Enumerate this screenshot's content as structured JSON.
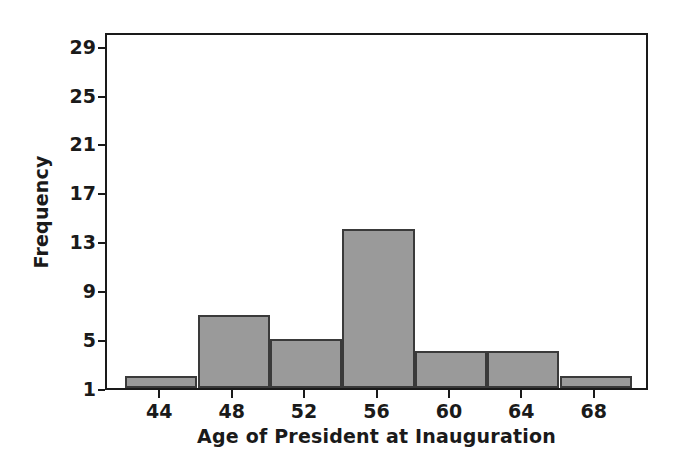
{
  "chart_data": {
    "type": "bar",
    "title": "",
    "subtitle": "",
    "xlabel": "Age of President at Inauguration",
    "ylabel": "Frequency",
    "categories": [
      "42-46",
      "46-50",
      "50-54",
      "54-58",
      "58-62",
      "62-66",
      "66-70"
    ],
    "bin_edges": [
      42,
      46,
      50,
      54,
      58,
      62,
      66,
      70
    ],
    "bin_width": 4,
    "values": [
      2,
      7,
      5,
      14,
      4,
      4,
      2
    ],
    "bars": [
      {
        "label": "42-46",
        "start": 42,
        "end": 46,
        "value": 2
      },
      {
        "label": "46-50",
        "start": 46,
        "end": 50,
        "value": 7
      },
      {
        "label": "50-54",
        "start": 50,
        "end": 54,
        "value": 5
      },
      {
        "label": "54-58",
        "start": 54,
        "end": 58,
        "value": 14
      },
      {
        "label": "58-62",
        "start": 58,
        "end": 62,
        "value": 4
      },
      {
        "label": "62-66",
        "start": 62,
        "end": 66,
        "value": 4
      },
      {
        "label": "66-70",
        "start": 66,
        "end": 70,
        "value": 2
      }
    ],
    "xlim": [
      41,
      71
    ],
    "ylim": [
      1,
      30.2
    ],
    "xticks": [
      44,
      48,
      52,
      56,
      60,
      64,
      68
    ],
    "xtick_labels": [
      "44",
      "48",
      "52",
      "56",
      "60",
      "64",
      "68"
    ],
    "yticks": [
      1,
      5,
      9,
      13,
      17,
      21,
      25,
      29
    ],
    "ytick_labels": [
      "1",
      "5",
      "9",
      "13",
      "17",
      "21",
      "25",
      "29"
    ],
    "grid": false,
    "legend": null,
    "colors": {
      "bar_fill": "#9a9a9a",
      "bar_edge": "#3a3a3a",
      "axis": "#1a1a1a",
      "background": "#ffffff",
      "text": "#1a1a1a"
    }
  }
}
